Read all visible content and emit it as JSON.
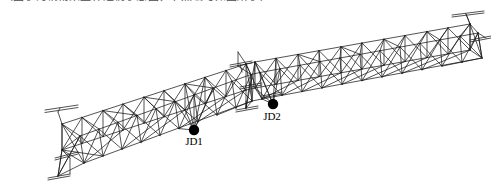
{
  "figure": {
    "caption_partial": "（图示为钢桁架整体透视示意图，节点编号如图所示）",
    "background_color": "#ffffff",
    "line_color": "#1a1a1a",
    "node_marker_color": "#000000",
    "view": "3D perspective, girder rises from lower-left to upper-right"
  },
  "annotations": {
    "nodes": [
      {
        "id": "JD1",
        "label": "JD1",
        "marker": "filled-circle",
        "x": 194,
        "y": 130,
        "label_x": 186,
        "label_y": 145
      },
      {
        "id": "JD2",
        "label": "JD2",
        "marker": "filled-circle",
        "x": 273,
        "y": 104,
        "label_x": 264,
        "label_y": 120
      }
    ]
  },
  "structure": {
    "type": "space-truss",
    "panels_left_segment": 9,
    "panels_right_segment": 10,
    "splice_x": 246,
    "bracket_count": 6,
    "bracket_shape": "T-bracket",
    "end_supports": [
      "left-base",
      "right-end-upper",
      "right-end-lower"
    ],
    "geometry": {
      "top_chord_far": [
        [
          62,
          124
        ],
        [
          247,
          64
        ],
        [
          470,
          24
        ]
      ],
      "top_chord_near": [
        [
          78,
          134
        ],
        [
          250,
          74
        ],
        [
          478,
          33
        ]
      ],
      "bottom_chord_far": [
        [
          62,
          150
        ],
        [
          247,
          90
        ],
        [
          470,
          50
        ]
      ],
      "bottom_chord_near": [
        [
          84,
          163
        ],
        [
          252,
          101
        ],
        [
          482,
          58
        ]
      ]
    }
  }
}
